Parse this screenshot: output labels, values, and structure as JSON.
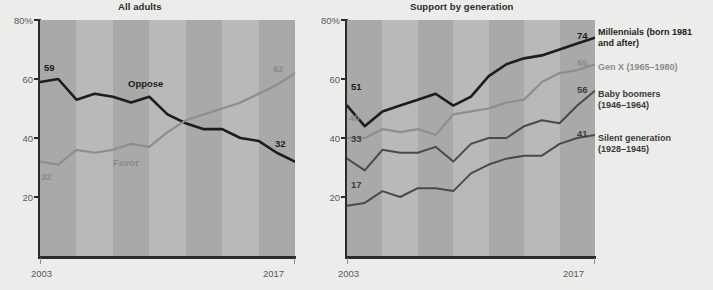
{
  "background_color": "#ececeb",
  "colors": {
    "dark_line": "#1d1d1b",
    "gray_line": "#8e8e8c",
    "mid_line": "#4a4a48",
    "plot_band_light": "#b9b9b7",
    "plot_band_dark": "#a9a9a7",
    "axis": "#2b2b2b",
    "tick_label": "#5a5a58"
  },
  "panels": {
    "left": {
      "title": "All adults",
      "y_axis": {
        "labels": [
          "80%",
          "60",
          "40",
          "20"
        ],
        "values": [
          80,
          60,
          40,
          20
        ]
      },
      "x_axis": {
        "labels": [
          "2003",
          "2017"
        ],
        "values": [
          2003,
          2017
        ]
      },
      "series_labels": {
        "oppose": "Oppose",
        "favor": "Favor"
      },
      "endpoint_labels": {
        "oppose_start": "59",
        "oppose_end": "32",
        "favor_start": "32",
        "favor_end": "62"
      }
    },
    "right": {
      "title": "Support by generation",
      "y_axis": {
        "labels": [
          "80%",
          "60",
          "40",
          "20"
        ],
        "values": [
          80,
          60,
          40,
          20
        ]
      },
      "x_axis": {
        "labels": [
          "2003",
          "2017"
        ],
        "values": [
          2003,
          2017
        ]
      },
      "legend": [
        {
          "name": "millennials",
          "line1": "Millennials (born 1981",
          "line2": "and after)",
          "color": "#1d1d1b"
        },
        {
          "name": "gen-x",
          "line1": "Gen X (1965–1980)",
          "line2": "",
          "color": "#8a8a88"
        },
        {
          "name": "baby-boomers",
          "line1": "Baby boomers",
          "line2": "(1946–1964)",
          "color": "#3a3a38"
        },
        {
          "name": "silent-generation",
          "line1": "Silent generation",
          "line2": "(1928–1945)",
          "color": "#3a3a38"
        }
      ],
      "endpoint_labels": {
        "millennials_start": "51",
        "millennials_end": "74",
        "genx_start": "40",
        "genx_end": "65",
        "boomers_start": "33",
        "boomers_end": "56",
        "silent_start": "17",
        "silent_end": "41"
      }
    }
  },
  "chart_data": [
    {
      "type": "line",
      "title": "All adults",
      "xlabel": "",
      "ylabel": "",
      "xlim": [
        2003,
        2017
      ],
      "ylim": [
        0,
        80
      ],
      "ytick_labels": [
        "80%",
        "60",
        "40",
        "20"
      ],
      "yticks": [
        80,
        60,
        40,
        20
      ],
      "xtick_labels": [
        "2003",
        "2017"
      ],
      "xticks": [
        2003,
        2017
      ],
      "grid": false,
      "legend_position": "inline",
      "x": [
        2003,
        2004,
        2005,
        2006,
        2007,
        2008,
        2009,
        2010,
        2011,
        2012,
        2013,
        2014,
        2015,
        2016,
        2017
      ],
      "series": [
        {
          "name": "Oppose",
          "color": "#1d1d1b",
          "values": [
            59,
            60,
            53,
            55,
            54,
            52,
            54,
            48,
            45,
            43,
            43,
            40,
            39,
            35,
            32
          ]
        },
        {
          "name": "Favor",
          "color": "#8e8e8c",
          "values": [
            32,
            31,
            36,
            35,
            36,
            38,
            37,
            42,
            46,
            48,
            50,
            52,
            55,
            58,
            62
          ]
        }
      ]
    },
    {
      "type": "line",
      "title": "Support by generation",
      "xlabel": "",
      "ylabel": "",
      "xlim": [
        2003,
        2017
      ],
      "ylim": [
        0,
        80
      ],
      "ytick_labels": [
        "80%",
        "60",
        "40",
        "20"
      ],
      "yticks": [
        80,
        60,
        40,
        20
      ],
      "xtick_labels": [
        "2003",
        "2017"
      ],
      "xticks": [
        2003,
        2017
      ],
      "grid": false,
      "legend_position": "right",
      "x": [
        2003,
        2004,
        2005,
        2006,
        2007,
        2008,
        2009,
        2010,
        2011,
        2012,
        2013,
        2014,
        2015,
        2016,
        2017
      ],
      "series": [
        {
          "name": "Millennials (born 1981 and after)",
          "color": "#1d1d1b",
          "values": [
            51,
            44,
            49,
            51,
            53,
            55,
            51,
            54,
            61,
            65,
            67,
            68,
            70,
            72,
            74
          ]
        },
        {
          "name": "Gen X (1965–1980)",
          "color": "#8e8e8c",
          "values": [
            40,
            40,
            43,
            42,
            43,
            41,
            48,
            49,
            50,
            52,
            53,
            59,
            62,
            63,
            65
          ]
        },
        {
          "name": "Baby boomers (1946–1964)",
          "color": "#4a4a48",
          "values": [
            33,
            29,
            36,
            35,
            35,
            37,
            32,
            38,
            40,
            40,
            44,
            46,
            45,
            51,
            56
          ]
        },
        {
          "name": "Silent generation (1928–1945)",
          "color": "#4a4a48",
          "values": [
            17,
            18,
            22,
            20,
            23,
            23,
            22,
            28,
            31,
            33,
            34,
            34,
            38,
            40,
            41
          ]
        }
      ]
    }
  ]
}
